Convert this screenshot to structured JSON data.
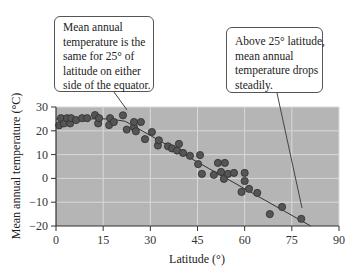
{
  "chart_data": {
    "type": "scatter",
    "title": "",
    "xlabel": "Latitude (°)",
    "ylabel": "Mean annual temperature (°C)",
    "xlim": [
      0,
      90
    ],
    "ylim": [
      -20,
      30
    ],
    "x_ticks": [
      0,
      15,
      30,
      45,
      60,
      75,
      90
    ],
    "y_ticks": [
      30,
      20,
      10,
      0,
      -10,
      -20
    ],
    "grid": true,
    "background_color": "#b5b5b5",
    "gridline_color": "#d9d9d9",
    "point_color": "#555555",
    "series": [
      {
        "name": "Observations",
        "points": [
          [
            1,
            22.3
          ],
          [
            1.6,
            25.3
          ],
          [
            2.5,
            23.1
          ],
          [
            3.5,
            25.3
          ],
          [
            4.5,
            23.1
          ],
          [
            4.8,
            25.3
          ],
          [
            6.4,
            24.5
          ],
          [
            8.3,
            25.3
          ],
          [
            9.9,
            25.3
          ],
          [
            12.4,
            26.6
          ],
          [
            13.4,
            23.1
          ],
          [
            13.7,
            25.3
          ],
          [
            16.9,
            22.4
          ],
          [
            17.2,
            25.3
          ],
          [
            18.4,
            23.7
          ],
          [
            21.3,
            26.5
          ],
          [
            22.5,
            20.5
          ],
          [
            24.8,
            21.5
          ],
          [
            24.8,
            23.7
          ],
          [
            25.4,
            19.8
          ],
          [
            27,
            23.7
          ],
          [
            28.3,
            16.5
          ],
          [
            30.5,
            19.5
          ],
          [
            32.4,
            13.8
          ],
          [
            32.7,
            16
          ],
          [
            35.6,
            13.5
          ],
          [
            36.9,
            12.6
          ],
          [
            38.5,
            11.7
          ],
          [
            39.1,
            14.5
          ],
          [
            40.4,
            10.7
          ],
          [
            42.6,
            9.5
          ],
          [
            45.2,
            6
          ],
          [
            45.8,
            9.8
          ],
          [
            46.4,
            1.9
          ],
          [
            50.2,
            1.5
          ],
          [
            51.5,
            6.5
          ],
          [
            52.5,
            2.7
          ],
          [
            53.4,
            -0.2
          ],
          [
            53.7,
            6.5
          ],
          [
            54.7,
            1.9
          ],
          [
            56.6,
            2.3
          ],
          [
            59,
            -5.7
          ],
          [
            60,
            2.3
          ],
          [
            60,
            -1.1
          ],
          [
            61.4,
            -4.4
          ],
          [
            64,
            -6.1
          ],
          [
            68,
            -15
          ],
          [
            71.9,
            -12
          ],
          [
            78,
            -17
          ]
        ]
      },
      {
        "name": "Trend line",
        "type": "line",
        "points": [
          [
            0,
            25
          ],
          [
            17,
            25
          ],
          [
            22,
            24
          ],
          [
            81,
            -20
          ]
        ]
      }
    ],
    "annotations": [
      {
        "text": "Mean annual temperature is the same for 25° of latitude on either side of the equator.",
        "points_to": [
          22,
          27
        ]
      },
      {
        "text": "Above 25° latitude, mean annual temperature drops steadily.",
        "points_to": [
          78,
          -13
        ]
      }
    ]
  },
  "callouts": {
    "left": {
      "lines": [
        "Mean annual",
        "temperature is the",
        "same for 25° of",
        "latitude on either",
        "side of the equator."
      ]
    },
    "right": {
      "lines": [
        "Above 25° latitude,",
        "mean annual",
        "temperature drops",
        "steadily."
      ]
    }
  }
}
